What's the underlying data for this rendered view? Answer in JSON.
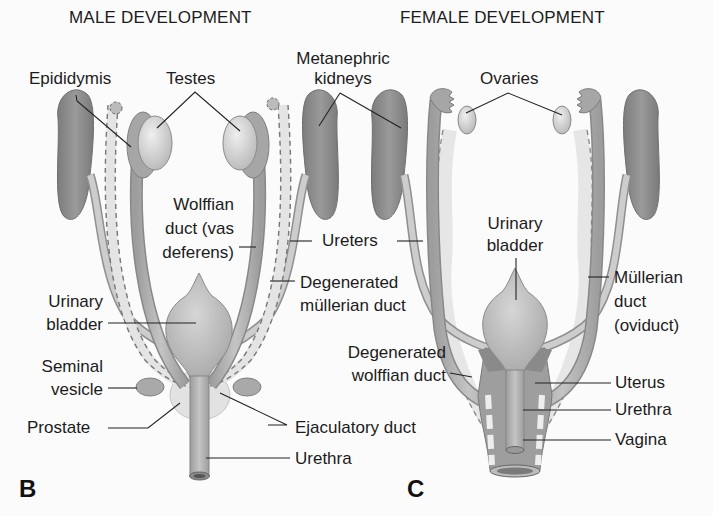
{
  "male": {
    "title": "MALE DEVELOPMENT",
    "panel_letter": "B",
    "labels": {
      "epididymis": "Epididymis",
      "testes": "Testes",
      "wolffian_1": "Wolffian",
      "wolffian_2": "duct (vas",
      "wolffian_3": "deferens)",
      "urinary_1": "Urinary",
      "urinary_2": "bladder",
      "seminal_1": "Seminal",
      "seminal_2": "vesicle",
      "prostate": "Prostate",
      "ejaculatory": "Ejaculatory duct",
      "urethra": "Urethra",
      "degen_mullerian_1": "Degenerated",
      "degen_mullerian_2": "müllerian duct"
    }
  },
  "shared": {
    "kidneys_1": "Metanephric",
    "kidneys_2": "kidneys",
    "ureters": "Ureters"
  },
  "female": {
    "title": "FEMALE DEVELOPMENT",
    "panel_letter": "C",
    "labels": {
      "ovaries": "Ovaries",
      "urinary_1": "Urinary",
      "urinary_2": "bladder",
      "mullerian_1": "Müllerian",
      "mullerian_2": "duct",
      "mullerian_3": "(oviduct)",
      "degen_wolffian_1": "Degenerated",
      "degen_wolffian_2": "wolffian duct",
      "uterus": "Uterus",
      "urethra": "Urethra",
      "vagina": "Vagina"
    }
  },
  "colors": {
    "kidney": "#8a8a8a",
    "duct": "#b5b5b5",
    "gonad": "#d8d8d8",
    "degenerated": "#e6e6e6",
    "leader": "#222222"
  }
}
